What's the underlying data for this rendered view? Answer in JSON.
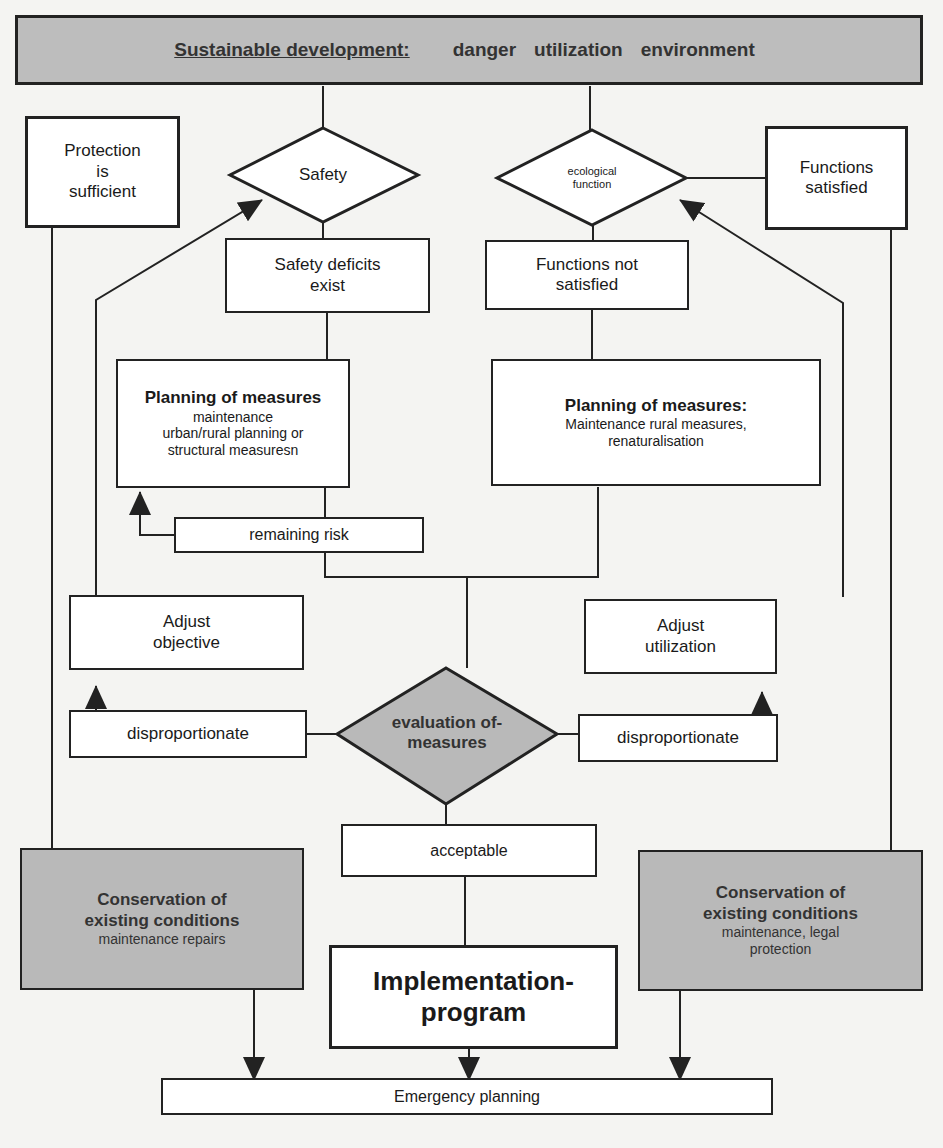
{
  "header": {
    "title": "Sustainable development:",
    "terms": [
      "danger",
      "utilization",
      "environment"
    ]
  },
  "left_branch": {
    "decision": "Safety",
    "positive_outcome": [
      "Protection",
      "is",
      "sufficient"
    ],
    "deficit": [
      "Safety deficits",
      "exist"
    ],
    "planning": {
      "title": "Planning of measures",
      "lines": [
        "maintenance",
        "urban/rural planning  or",
        "structural measuresn"
      ]
    },
    "remaining_risk": "remaining risk",
    "adjust": [
      "Adjust",
      "objective"
    ],
    "disproportionate": "disproportionate",
    "conservation": {
      "title": [
        "Conservation of",
        "existing conditions"
      ],
      "subtitle": [
        "maintenance repairs"
      ]
    }
  },
  "right_branch": {
    "decision": [
      "ecological",
      "function"
    ],
    "positive_outcome": [
      "Functions",
      "satisfied"
    ],
    "deficit": [
      "Functions not",
      "satisfied"
    ],
    "planning": {
      "title": "Planning of measures:",
      "lines": [
        "Maintenance rural measures,",
        "renaturalisation"
      ]
    },
    "adjust": [
      "Adjust",
      "utilization"
    ],
    "disproportionate": "disproportionate",
    "conservation": {
      "title": [
        "Conservation of",
        "existing conditions"
      ],
      "subtitle": [
        "maintenance, legal",
        "protection"
      ]
    }
  },
  "center": {
    "evaluation": [
      "evaluation of-",
      "measures"
    ],
    "acceptable": "acceptable",
    "implementation": [
      "Implementation-",
      "program"
    ],
    "emergency": "Emergency planning"
  },
  "colors": {
    "line": "#222222",
    "gray_fill": "#b9b9b9",
    "header_fill": "#bdbdbd",
    "background": "#f4f4f2"
  }
}
